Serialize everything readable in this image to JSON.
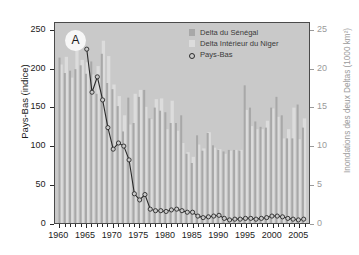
{
  "figure": {
    "panel_label": "A"
  },
  "legend": {
    "position": "top-right",
    "items": [
      {
        "label": "Delta du Sénégal",
        "type": "bar",
        "color": "#a8a8a8"
      },
      {
        "label": "Delta Intérieur du Niger",
        "type": "bar",
        "color": "#dcdcdc"
      },
      {
        "label": "Pays-Bas",
        "type": "marker",
        "color": "#2a2a2a"
      }
    ]
  },
  "axes": {
    "left": {
      "title": "Pays-Bas (indice)",
      "ticks": [
        0,
        50,
        100,
        150,
        200,
        250
      ],
      "min": 0,
      "max": 260
    },
    "right": {
      "title": "Inondations des deux Deltas (1000 km²)",
      "ticks": [
        0,
        5,
        10,
        15,
        20,
        25
      ],
      "min": 0,
      "max": 26
    },
    "bottom": {
      "title": "",
      "ticks": [
        1960,
        1965,
        1970,
        1975,
        1980,
        1985,
        1990,
        1995,
        2000,
        2005
      ],
      "min": 1959,
      "max": 2007
    }
  },
  "chart_data": {
    "type": "bar",
    "title": "",
    "subtitle": "",
    "xlabel": "",
    "ylabel": "Pays-Bas (indice)",
    "ylabel_right": "Inondations des deux Deltas (1000 km²)",
    "ylim": [
      0,
      260
    ],
    "ylim_right": [
      0,
      26
    ],
    "xlim": [
      1959,
      2007
    ],
    "grid": false,
    "legend_position": "top-right",
    "x": [
      1960,
      1961,
      1962,
      1963,
      1964,
      1965,
      1966,
      1967,
      1968,
      1969,
      1970,
      1971,
      1972,
      1973,
      1974,
      1975,
      1976,
      1977,
      1978,
      1979,
      1980,
      1981,
      1982,
      1983,
      1984,
      1985,
      1986,
      1987,
      1988,
      1989,
      1990,
      1991,
      1992,
      1993,
      1994,
      1995,
      1996,
      1997,
      1998,
      1999,
      2000,
      2001,
      2002,
      2003,
      2004,
      2005,
      2006
    ],
    "series": [
      {
        "name": "Delta du Sénégal",
        "axis": "right",
        "units": "1000 km²",
        "type": "bar",
        "color": "#a8a8a8",
        "values": [
          21.5,
          19.5,
          19.8,
          20.0,
          20.5,
          19.4,
          21.0,
          16.8,
          22.0,
          18.2,
          17.4,
          15.2,
          11.9,
          16.3,
          13.0,
          16.4,
          17.3,
          13.6,
          15.0,
          14.6,
          14.4,
          13.0,
          13.0,
          14.0,
          9.0,
          7.8,
          11.4,
          9.4,
          11.7,
          10.1,
          9.5,
          9.3,
          9.5,
          9.5,
          9.4,
          17.9,
          15.0,
          13.2,
          12.5,
          12.4,
          15.0,
          16.4,
          14.0,
          11.0,
          11.0,
          15.4,
          12.4
        ]
      },
      {
        "name": "Delta Intérieur du Niger",
        "axis": "right",
        "units": "1000 km²",
        "type": "bar",
        "color": "#dcdcdc",
        "values": [
          20.6,
          21.6,
          18.9,
          23.7,
          21.2,
          20.9,
          19.3,
          20.4,
          23.7,
          21.7,
          18.0,
          16.5,
          14.0,
          12.8,
          16.8,
          17.3,
          15.1,
          13.5,
          16.1,
          16.2,
          12.2,
          15.9,
          12.0,
          10.4,
          9.2,
          8.6,
          10.2,
          9.7,
          11.8,
          9.8,
          9.6,
          9.0,
          9.4,
          9.5,
          9.5,
          14.7,
          12.6,
          12.2,
          12.2,
          13.3,
          14.9,
          13.8,
          11.0,
          12.2,
          15.0,
          10.9,
          13.6
        ]
      },
      {
        "name": "Pays-Bas",
        "axis": "left",
        "units": "indice",
        "type": "line",
        "color": "#2a2a2a",
        "marker": "circle-open",
        "x": [
          1965,
          1966,
          1967,
          1968,
          1969,
          1970,
          1971,
          1972,
          1973,
          1974,
          1975,
          1976,
          1977,
          1978,
          1979,
          1980,
          1981,
          1982,
          1983,
          1984,
          1985,
          1986,
          1987,
          1988,
          1989,
          1990,
          1991,
          1992,
          1993,
          1994,
          1995,
          1996,
          1997,
          1998,
          1999,
          2000,
          2001,
          2002,
          2003,
          2004,
          2005,
          2006
        ],
        "values": [
          226,
          170,
          190,
          160,
          124,
          96,
          104,
          100,
          82,
          38,
          30,
          37,
          18,
          16,
          16,
          15,
          17,
          18,
          16,
          14,
          14,
          9,
          7,
          8,
          9,
          10,
          6,
          4,
          5,
          5,
          6,
          6,
          5,
          6,
          7,
          9,
          9,
          8,
          6,
          5,
          4,
          5
        ]
      }
    ]
  }
}
